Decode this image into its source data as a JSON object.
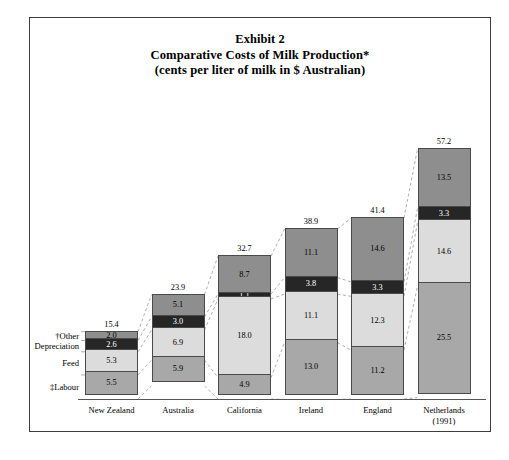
{
  "title": {
    "line1": "Exhibit 2",
    "line2": "Comparative Costs of Milk Production*",
    "line3": "(cents per liter of milk in $ Australian)"
  },
  "legend": {
    "other": "†Other",
    "depreciation": "Depreciation",
    "feed": "Feed",
    "labour": "‡Labour"
  },
  "colors": {
    "other": "#8e8e8e",
    "depreciation": "#262626",
    "feed": "#dcdcdc",
    "labour": "#a8a8a8",
    "border": "#4a4a4a",
    "frame": "#3d3d3d",
    "leader": "#9a9a9a"
  },
  "chart_data": {
    "type": "bar",
    "xlabel": "",
    "ylabel": "cents per liter of milk in $ Australian",
    "stacked": true,
    "grid": false,
    "legend_position": "left-axis-labels",
    "ylim": [
      0,
      57.2
    ],
    "categories": [
      "New Zealand",
      "Australia",
      "California",
      "Ireland",
      "England",
      "Netherlands"
    ],
    "category_sublabels": [
      "",
      "",
      "",
      "",
      "",
      "(1991)"
    ],
    "series": [
      {
        "name": "‡Labour",
        "values": [
          5.5,
          5.9,
          4.9,
          13.0,
          11.2,
          25.5
        ]
      },
      {
        "name": "Feed",
        "values": [
          5.3,
          6.9,
          18.0,
          11.1,
          12.3,
          14.6
        ]
      },
      {
        "name": "Depreciation",
        "values": [
          2.6,
          3.0,
          1.1,
          3.8,
          3.3,
          3.3
        ]
      },
      {
        "name": "†Other",
        "values": [
          2.0,
          5.1,
          8.7,
          11.1,
          14.6,
          13.5
        ]
      }
    ],
    "totals": [
      15.4,
      23.9,
      32.7,
      38.9,
      41.4,
      57.2
    ]
  }
}
